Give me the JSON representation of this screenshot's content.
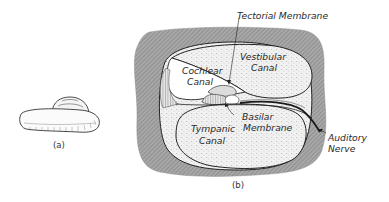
{
  "figure": {
    "panel_a": {
      "caption": "(a)",
      "subject": "cochlea-external-shell"
    },
    "panel_b": {
      "caption": "(b)",
      "subject": "cochlea-cross-section",
      "labels": {
        "tectorial_membrane": "Tectorial Membrane",
        "vestibular_canal_1": "Vestibular",
        "vestibular_canal_2": "Canal",
        "cochlear_canal_1": "Cochlear",
        "cochlear_canal_2": "Canal",
        "basilar_membrane_1": "Basilar",
        "basilar_membrane_2": "Membrane",
        "tympanic_canal_1": "Tympanic",
        "tympanic_canal_2": "Canal",
        "auditory_nerve_1": "Auditory",
        "auditory_nerve_2": "Nerve"
      }
    },
    "colors": {
      "bone": "#9a9a9a",
      "fluid": "#ececec",
      "ink": "#2a2a2a",
      "background": "#ffffff"
    }
  }
}
